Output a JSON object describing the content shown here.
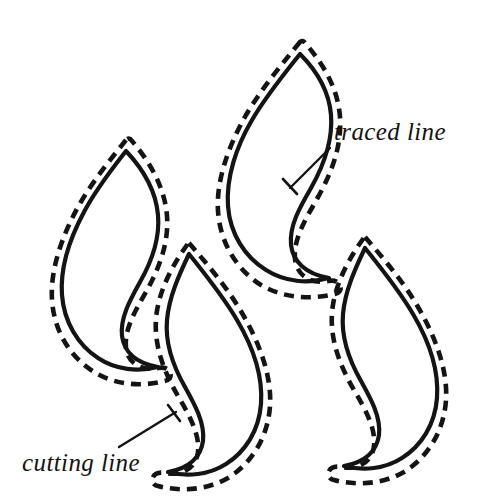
{
  "figure": {
    "background_color": "#ffffff",
    "ink_color": "#141414",
    "width": 493,
    "height": 499
  },
  "labels": {
    "traced_line": "traced line",
    "cutting_line": "cutting line"
  },
  "legend_meaning": {
    "solid_stroke": "traced line",
    "dashed_stroke": "cutting line"
  },
  "shapes": [
    {
      "id": "shape-top-left",
      "name": "pattern-piece-upper-left",
      "orientation": "tip-up-right",
      "traced_path": "M 126 151 C 112 169 96 189 84 212 C 70 238 60 268 62 295 C 64 322 78 345 98 358 C 116 370 138 372 158 367 C 135 363 124 351 122 336 C 120 318 130 300 140 282 C 152 261 160 238 158 215 C 156 192 144 170 126 151 Z",
      "cutting_path": "M 126 140 C 110 160 92 182 78 207 C 62 236 50 270 52 300 C 54 331 70 357 94 372 C 115 385 141 387 165 381 C 170 380 172 376 170 372 C 168 368 163 367 158 368 C 142 371 128 364 126 348 C 124 330 135 311 146 292 C 159 269 169 243 167 216 C 165 188 150 162 132 141 C 130 138 128 138 126 140 Z"
    },
    {
      "id": "shape-top-center",
      "name": "pattern-piece-upper-center",
      "orientation": "tip-up-right",
      "traced_path": "M 300 54 C 284 74 266 96 252 120 C 236 147 226 178 228 206 C 230 234 245 257 266 270 C 285 282 308 284 329 278 C 305 274 293 261 291 245 C 289 226 300 207 311 188 C 324 165 333 140 331 115 C 329 90 316 70 300 54 Z",
      "cutting_path": "M 300 42 C 282 64 262 88 246 115 C 229 145 216 180 218 211 C 220 243 237 270 261 285 C 283 298 310 300 335 294 C 340 293 342 289 340 285 C 338 281 333 280 328 281 C 312 284 297 277 295 259 C 293 240 305 220 317 199 C 331 174 342 147 340 117 C 338 88 323 64 306 44 C 304 41 302 40 300 42 Z"
    },
    {
      "id": "shape-bottom-center",
      "name": "pattern-piece-lower-center",
      "orientation": "tip-down-left",
      "traced_path": "M 189 254 C 205 274 223 296 237 320 C 253 347 263 377 261 404 C 259 431 245 452 226 464 C 209 475 187 477 168 472 C 190 468 201 456 203 441 C 205 423 195 405 185 387 C 173 366 165 343 167 320 C 169 297 179 275 189 254 Z",
      "cutting_path": "M 189 243 C 207 264 227 287 242 313 C 259 342 272 376 270 406 C 268 437 252 463 228 478 C 207 490 181 492 158 486 C 153 485 151 481 153 477 C 155 473 160 472 165 473 C 181 476 196 469 198 452 C 200 434 189 415 178 396 C 164 372 154 346 156 319 C 158 292 172 266 187 245 C 189 242 187 241 189 243 Z"
    },
    {
      "id": "shape-bottom-right",
      "name": "pattern-piece-lower-right",
      "orientation": "tip-down-left",
      "traced_path": "M 365 248 C 381 268 399 290 413 314 C 429 341 439 371 437 398 C 435 425 421 446 402 458 C 385 469 363 471 344 466 C 366 462 377 450 379 435 C 381 417 371 399 361 381 C 349 360 341 337 343 314 C 345 291 355 269 365 248 Z",
      "cutting_path": "M 365 237 C 383 258 403 281 418 307 C 435 336 448 370 446 400 C 444 431 428 457 404 472 C 383 484 357 486 334 480 C 329 479 327 475 329 471 C 331 467 336 466 341 467 C 357 470 372 463 374 446 C 376 428 365 409 354 390 C 340 366 330 340 332 313 C 334 286 348 260 363 239 C 365 236 363 235 365 237 Z"
    }
  ],
  "annotations": [
    {
      "id": "annotation-traced-line",
      "target": "solid line on upper-center pattern piece",
      "label_key": "traced_line",
      "label_x": 334,
      "label_y": 140,
      "leader_from_x": 330,
      "leader_from_y": 148,
      "leader_to_x": 290,
      "leader_to_y": 188,
      "tick_from_x": 283,
      "tick_from_y": 179,
      "tick_to_x": 297,
      "tick_to_y": 194
    },
    {
      "id": "annotation-cutting-line",
      "target": "dashed line on lower-center pattern piece",
      "label_key": "cutting_line",
      "label_x": 22,
      "label_y": 471,
      "leader_from_x": 119,
      "leader_from_y": 447,
      "leader_to_x": 176,
      "leader_to_y": 412,
      "tick_from_x": 168,
      "tick_from_y": 405,
      "tick_to_x": 180,
      "tick_to_y": 421
    }
  ]
}
